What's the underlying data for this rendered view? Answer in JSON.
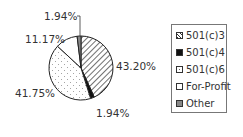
{
  "chart_data": {
    "type": "pie",
    "title": "",
    "start_angle": "12 o'clock",
    "direction": "clockwise",
    "categories": [
      "501(c)3",
      "501(c)4",
      "501(c)6",
      "For-Profit",
      "Other"
    ],
    "values": [
      43.2,
      1.94,
      41.75,
      11.17,
      1.94
    ],
    "labels": [
      "43.20%",
      "1.94%",
      "41.75%",
      "11.17%",
      "1.94%"
    ],
    "fills": [
      "hatch",
      "#111111",
      "dots",
      "#ffffff",
      "#888888"
    ],
    "legend_position": "right"
  },
  "labels": {
    "c3": "43.20%",
    "c4": "1.94%",
    "c6": "41.75%",
    "forprofit": "11.17%",
    "other": "1.94%"
  },
  "legend": {
    "items": [
      {
        "label": "501(c)3"
      },
      {
        "label": "501(c)4"
      },
      {
        "label": "501(c)6"
      },
      {
        "label": "For-Profit"
      },
      {
        "label": "Other"
      }
    ]
  }
}
